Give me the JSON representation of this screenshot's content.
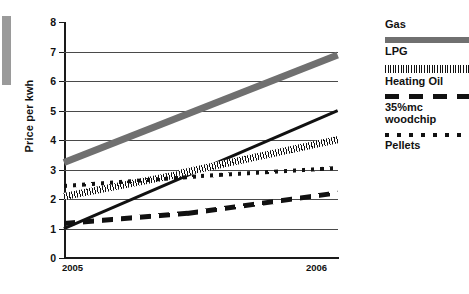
{
  "chart_data": {
    "type": "line",
    "title": "",
    "xlabel": "",
    "ylabel": "Price per kwh",
    "xlim": [
      2005,
      2006
    ],
    "ylim": [
      0,
      8
    ],
    "grid": true,
    "legend_position": "right",
    "x": [
      2005,
      2006
    ],
    "y_ticks": [
      "0",
      "1",
      "2",
      "3",
      "4",
      "5",
      "6",
      "7",
      "8"
    ],
    "x_ticks": [
      "2005",
      "2006"
    ],
    "series": [
      {
        "name": "Gas",
        "style": "solid",
        "color": "#111111",
        "x": [
          2005,
          2006
        ],
        "values": [
          1.0,
          5.0
        ]
      },
      {
        "name": "LPG",
        "style": "thick-solid",
        "color": "#707070",
        "x": [
          2005,
          2006
        ],
        "values": [
          3.25,
          6.9
        ]
      },
      {
        "name": "Heating Oil",
        "style": "hatched",
        "color": "#111111",
        "x": [
          2005,
          2005.42,
          2006
        ],
        "values": [
          2.1,
          2.85,
          4.0
        ]
      },
      {
        "name": "35%mc woodchip",
        "style": "dashed",
        "color": "#111111",
        "x": [
          2005,
          2005.45,
          2006
        ],
        "values": [
          1.15,
          1.5,
          2.2
        ]
      },
      {
        "name": "Pellets",
        "style": "dotted",
        "color": "#111111",
        "x": [
          2005,
          2005.5,
          2006
        ],
        "values": [
          2.45,
          2.78,
          3.05
        ]
      }
    ]
  },
  "axes": {
    "y_title": "Price per kwh",
    "y_ticks": [
      "8",
      "7",
      "6",
      "5",
      "4",
      "3",
      "2",
      "1",
      "0"
    ],
    "x_tick_left": "2005",
    "x_tick_right": "2006"
  },
  "legend": {
    "entries": [
      {
        "label": "Gas",
        "swatch": "none"
      },
      {
        "label": "LPG",
        "swatch": "gray-bar"
      },
      {
        "label": "Heating Oil",
        "swatch": "hatched-bar"
      },
      {
        "label": "35%mc\nwoodchip",
        "swatch": "dashed-bar"
      },
      {
        "label": "Pellets",
        "swatch": "dotted-bar"
      }
    ]
  },
  "colors": {
    "lpg_gray": "#707070",
    "line_black": "#111111",
    "gridline": "#4a4a4a",
    "edge_artifact": "#9a9a9a"
  }
}
